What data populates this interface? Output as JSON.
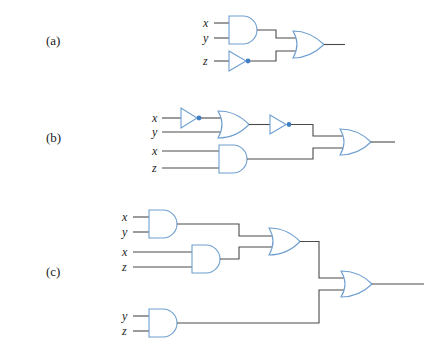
{
  "figure": {
    "parts": [
      {
        "id": "a",
        "label": "(a)",
        "inputs": [
          "x",
          "y",
          "z"
        ],
        "gates": [
          {
            "type": "AND",
            "inputs": [
              "x",
              "y"
            ]
          },
          {
            "type": "NOT",
            "inputs": [
              "z"
            ]
          },
          {
            "type": "OR",
            "inputs": [
              "AND(x,y)",
              "NOT(z)"
            ]
          }
        ],
        "expression": "xy + z'"
      },
      {
        "id": "b",
        "label": "(b)",
        "inputs": [
          "x",
          "y",
          "x",
          "z"
        ],
        "gates": [
          {
            "type": "NOT",
            "inputs": [
              "x"
            ]
          },
          {
            "type": "OR",
            "inputs": [
              "NOT(x)",
              "y"
            ]
          },
          {
            "type": "NOT",
            "inputs": [
              "OR(x',y)"
            ]
          },
          {
            "type": "AND",
            "inputs": [
              "x",
              "z"
            ]
          },
          {
            "type": "OR",
            "inputs": [
              "NOT(x'+y)",
              "AND(x,z)"
            ]
          }
        ],
        "expression": "(x' + y)' + xz"
      },
      {
        "id": "c",
        "label": "(c)",
        "inputs": [
          "x",
          "y",
          "x",
          "z",
          "y",
          "z"
        ],
        "gates": [
          {
            "type": "AND",
            "inputs": [
              "x",
              "y"
            ]
          },
          {
            "type": "AND",
            "inputs": [
              "x",
              "z"
            ]
          },
          {
            "type": "OR",
            "inputs": [
              "AND(x,y)",
              "AND(x,z)"
            ]
          },
          {
            "type": "AND",
            "inputs": [
              "y",
              "z"
            ]
          },
          {
            "type": "OR",
            "inputs": [
              "OR(xy,xz)",
              "AND(y,z)"
            ]
          }
        ],
        "expression": "xy + xz + yz"
      }
    ],
    "colors": {
      "gate_stroke": "#6f9fd0",
      "wire": "#4a4a4a",
      "bubble": "#3f7fc4"
    }
  }
}
